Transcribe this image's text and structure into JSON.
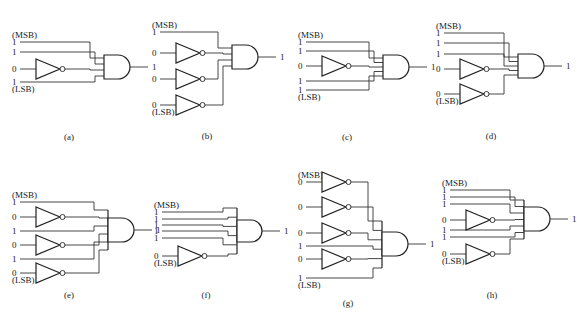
{
  "figure": {
    "msb_label": "(MSB)",
    "lsb_label": "(LSB)",
    "circuits": [
      {
        "id": "a",
        "caption": "(a)",
        "origin": [
          18,
          30
        ],
        "inputs": [
          "1",
          "1",
          "0",
          "1"
        ],
        "input_y": [
          12,
          22,
          39,
          52
        ],
        "inverted": [
          false,
          false,
          true,
          false
        ],
        "output": "1",
        "gate_x": 86,
        "gate_top": 25,
        "gate_bottom": 49,
        "caption_pos": [
          69,
          140
        ]
      },
      {
        "id": "b",
        "caption": "(b)",
        "origin": [
          158,
          20
        ],
        "inputs": [
          "1",
          "0",
          "0",
          "0"
        ],
        "input_y": [
          12,
          33,
          59,
          85
        ],
        "inverted": [
          false,
          true,
          true,
          true
        ],
        "output": "1",
        "gate_x": 74,
        "gate_top": 25,
        "gate_bottom": 49,
        "caption_pos": [
          207,
          139
        ]
      },
      {
        "id": "c",
        "caption": "(c)",
        "origin": [
          304,
          40
        ],
        "inputs": [
          "1",
          "1",
          "0",
          "1",
          "1"
        ],
        "input_y": [
          2,
          11,
          26,
          41,
          50
        ],
        "inverted": [
          false,
          false,
          true,
          false,
          false
        ],
        "output": "1",
        "gate_x": 79,
        "gate_top": 15,
        "gate_bottom": 39,
        "caption_pos": [
          347,
          140
        ]
      },
      {
        "id": "d",
        "caption": "(d)",
        "origin": [
          442,
          32
        ],
        "inputs": [
          "1",
          "1",
          "1",
          "0",
          "0"
        ],
        "input_y": [
          1,
          11,
          22,
          37,
          62
        ],
        "inverted": [
          false,
          false,
          false,
          true,
          true
        ],
        "output": "1",
        "gate_x": 76,
        "gate_top": 22,
        "gate_bottom": 46,
        "caption_pos": [
          491,
          139
        ]
      },
      {
        "id": "e",
        "caption": "(e)",
        "origin": [
          18,
          202
        ],
        "inputs": [
          "1",
          "0",
          "1",
          "0",
          "1",
          "0"
        ],
        "input_y": [
          0,
          15,
          29,
          43,
          57,
          71
        ],
        "inverted": [
          false,
          true,
          false,
          true,
          false,
          true
        ],
        "output": "1",
        "gate_x": 90,
        "gate_top": 16,
        "gate_bottom": 40,
        "bar": [
          8,
          48
        ],
        "caption_pos": [
          69,
          298
        ]
      },
      {
        "id": "f",
        "caption": "(f)",
        "origin": [
          160,
          212
        ],
        "inputs": [
          "1",
          "1",
          "1",
          "1",
          "1",
          "0"
        ],
        "input_y": [
          0,
          7,
          13,
          19,
          26,
          44
        ],
        "inverted": [
          false,
          false,
          false,
          false,
          false,
          true
        ],
        "output": "1",
        "gate_x": 77,
        "gate_top": 8,
        "gate_bottom": 30,
        "bar": [
          -4,
          42
        ],
        "caption_pos": [
          206,
          298
        ]
      },
      {
        "id": "g",
        "caption": "(g)",
        "origin": [
          304,
          182
        ],
        "inputs": [
          "0",
          "0",
          "0",
          "1",
          "0",
          "1"
        ],
        "input_y": [
          0,
          25,
          51,
          64,
          77,
          96
        ],
        "inverted": [
          true,
          true,
          true,
          false,
          true,
          false
        ],
        "output": "1",
        "gate_x": 78,
        "gate_top": 50,
        "gate_bottom": 74,
        "bar": [
          39,
          86
        ],
        "caption_pos": [
          348,
          306
        ]
      },
      {
        "id": "h",
        "caption": "(h)",
        "origin": [
          448,
          190
        ],
        "inputs": [
          "1",
          "1",
          "1",
          "0",
          "1",
          "1",
          "0"
        ],
        "input_y": [
          0,
          7,
          14,
          30,
          40,
          47,
          64
        ],
        "inverted": [
          false,
          false,
          false,
          true,
          false,
          false,
          true
        ],
        "output": "1",
        "gate_x": 76,
        "gate_top": 17,
        "gate_bottom": 41,
        "bar": [
          10,
          49
        ],
        "caption_pos": [
          492,
          298
        ]
      }
    ]
  }
}
